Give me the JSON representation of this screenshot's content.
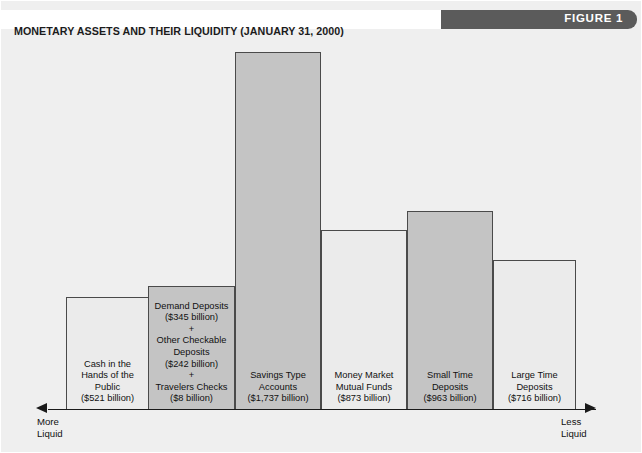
{
  "figure": {
    "badge": "FIGURE 1",
    "title": "MONETARY ASSETS AND THEIR LIQUIDITY (JANUARY 31, 2000)"
  },
  "axis": {
    "left_label": "More\nLiquid",
    "right_label": "Less\nLiquid"
  },
  "colors": {
    "background": "#efefef",
    "banner": "#5b5b5b",
    "bar_light": "#ebebeb",
    "bar_dark": "#c4c4c4",
    "bar_border": "#4a4a4a",
    "axis": "#1a1a1a",
    "text": "#111111"
  },
  "chart_data": {
    "type": "bar",
    "title": "MONETARY ASSETS AND THEIR LIQUIDITY (JANUARY 31, 2000)",
    "xlabel": "Liquidity (More Liquid ← → Less Liquid)",
    "ylabel": "Billions of dollars",
    "grid": false,
    "legend": "none",
    "unit": "billion dollars",
    "ylim": [
      0,
      1737
    ],
    "categories": [
      "Cash in the Hands of the Public",
      "Demand Deposits + Other Checkable Deposits + Travelers Checks",
      "Savings Type Accounts",
      "Money Market Mutual Funds",
      "Small Time Deposits",
      "Large Time Deposits"
    ],
    "values": [
      521,
      595,
      1737,
      873,
      963,
      716
    ],
    "bars": [
      {
        "label": "Cash in the\nHands of the\nPublic\n($521 billion)",
        "value": 521,
        "value_text": "($521 billion)",
        "shade": "light",
        "x": 65,
        "width": 83,
        "top": 262,
        "height": 113
      },
      {
        "label": "Demand Deposits\n($345 billion)\n+\nOther Checkable\nDeposits\n($242 billion)\n+\nTravelers Checks\n($8 billion)",
        "value": 595,
        "value_text": "($345 billion) + ($242 billion) + ($8 billion)",
        "shade": "dark",
        "components": [
          {
            "name": "Demand Deposits",
            "value": 345,
            "value_text": "($345 billion)"
          },
          {
            "name": "Other Checkable Deposits",
            "value": 242,
            "value_text": "($242 billion)"
          },
          {
            "name": "Travelers Checks",
            "value": 8,
            "value_text": "($8 billion)"
          }
        ],
        "x": 147,
        "width": 87,
        "top": 251,
        "height": 124
      },
      {
        "label": "Savings Type\nAccounts\n($1,737 billion)",
        "value": 1737,
        "value_text": "($1,737 billion)",
        "shade": "dark",
        "x": 234,
        "width": 86,
        "top": 17,
        "height": 358
      },
      {
        "label": "Money Market\nMutual Funds\n($873 billion)",
        "value": 873,
        "value_text": "($873 billion)",
        "shade": "light",
        "x": 320,
        "width": 86,
        "top": 195,
        "height": 180
      },
      {
        "label": "Small Time\nDeposits\n($963 billion)",
        "value": 963,
        "value_text": "($963 billion)",
        "shade": "dark",
        "x": 406,
        "width": 86,
        "top": 176,
        "height": 199
      },
      {
        "label": "Large Time\nDeposits\n($716 billion)",
        "value": 716,
        "value_text": "($716 billion)",
        "shade": "light",
        "x": 492,
        "width": 83,
        "top": 225,
        "height": 150
      }
    ]
  }
}
